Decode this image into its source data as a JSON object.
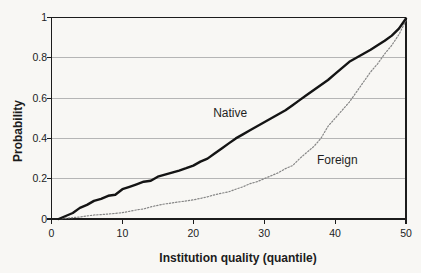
{
  "figure": {
    "background": "#f8f7f4",
    "frame_color": "#1c1c1c",
    "grid_color": "#b5b5b5",
    "text_color": "#1c1c1c"
  },
  "chart_data": {
    "type": "line",
    "title": "",
    "xlabel": "Institution quality (quantile)",
    "ylabel": "Probability",
    "xlim": [
      0,
      50
    ],
    "ylim": [
      0,
      1
    ],
    "x_ticks": [
      "0",
      "10",
      "20",
      "30",
      "40",
      "50"
    ],
    "y_ticks": [
      "0",
      "0.2",
      "0.4",
      "0.6",
      "0.8",
      "1"
    ],
    "y_gridlines": [
      0.2,
      0.4,
      0.6,
      0.8
    ],
    "grid": "horizontal",
    "legend_position": "inline-labels",
    "series": [
      {
        "name": "Native",
        "style": "solid",
        "color": "#141414",
        "width": 2.4,
        "label_pos": {
          "x": 25.2,
          "y": 0.525
        },
        "points": [
          [
            1,
            0
          ],
          [
            2,
            0.015
          ],
          [
            3,
            0.03
          ],
          [
            4,
            0.055
          ],
          [
            5,
            0.07
          ],
          [
            6,
            0.09
          ],
          [
            7,
            0.1
          ],
          [
            8,
            0.115
          ],
          [
            9,
            0.12
          ],
          [
            10,
            0.148
          ],
          [
            11,
            0.16
          ],
          [
            12,
            0.172
          ],
          [
            13,
            0.185
          ],
          [
            14,
            0.19
          ],
          [
            15,
            0.21
          ],
          [
            16,
            0.22
          ],
          [
            17,
            0.23
          ],
          [
            18,
            0.24
          ],
          [
            19,
            0.252
          ],
          [
            20,
            0.265
          ],
          [
            21,
            0.285
          ],
          [
            22,
            0.3
          ],
          [
            23,
            0.325
          ],
          [
            24,
            0.35
          ],
          [
            25,
            0.375
          ],
          [
            26,
            0.4
          ],
          [
            27,
            0.42
          ],
          [
            28,
            0.44
          ],
          [
            29,
            0.46
          ],
          [
            30,
            0.48
          ],
          [
            31,
            0.5
          ],
          [
            32,
            0.52
          ],
          [
            33,
            0.54
          ],
          [
            34,
            0.565
          ],
          [
            35,
            0.59
          ],
          [
            36,
            0.615
          ],
          [
            37,
            0.64
          ],
          [
            38,
            0.665
          ],
          [
            39,
            0.69
          ],
          [
            40,
            0.72
          ],
          [
            41,
            0.75
          ],
          [
            42,
            0.78
          ],
          [
            43,
            0.8
          ],
          [
            44,
            0.82
          ],
          [
            45,
            0.84
          ],
          [
            46,
            0.862
          ],
          [
            47,
            0.885
          ],
          [
            48,
            0.91
          ],
          [
            49,
            0.945
          ],
          [
            50,
            0.995
          ]
        ]
      },
      {
        "name": "Foreign",
        "style": "dotted",
        "color": "#868686",
        "width": 1.2,
        "label_pos": {
          "x": 40.3,
          "y": 0.293
        },
        "points": [
          [
            1,
            0
          ],
          [
            2,
            0.004
          ],
          [
            3,
            0.007
          ],
          [
            4,
            0.01
          ],
          [
            5,
            0.015
          ],
          [
            6,
            0.02
          ],
          [
            7,
            0.022
          ],
          [
            8,
            0.025
          ],
          [
            9,
            0.028
          ],
          [
            10,
            0.032
          ],
          [
            11,
            0.038
          ],
          [
            12,
            0.045
          ],
          [
            13,
            0.05
          ],
          [
            14,
            0.06
          ],
          [
            15,
            0.068
          ],
          [
            16,
            0.075
          ],
          [
            17,
            0.08
          ],
          [
            18,
            0.085
          ],
          [
            19,
            0.09
          ],
          [
            20,
            0.095
          ],
          [
            21,
            0.102
          ],
          [
            22,
            0.11
          ],
          [
            23,
            0.12
          ],
          [
            24,
            0.128
          ],
          [
            25,
            0.135
          ],
          [
            26,
            0.148
          ],
          [
            27,
            0.16
          ],
          [
            28,
            0.175
          ],
          [
            29,
            0.185
          ],
          [
            30,
            0.2
          ],
          [
            31,
            0.215
          ],
          [
            32,
            0.23
          ],
          [
            33,
            0.25
          ],
          [
            34,
            0.265
          ],
          [
            35,
            0.3
          ],
          [
            36,
            0.33
          ],
          [
            37,
            0.36
          ],
          [
            38,
            0.4
          ],
          [
            39,
            0.46
          ],
          [
            40,
            0.5
          ],
          [
            41,
            0.54
          ],
          [
            42,
            0.58
          ],
          [
            43,
            0.63
          ],
          [
            44,
            0.68
          ],
          [
            45,
            0.73
          ],
          [
            46,
            0.77
          ],
          [
            47,
            0.82
          ],
          [
            48,
            0.862
          ],
          [
            49,
            0.915
          ],
          [
            50,
            0.985
          ]
        ]
      }
    ]
  }
}
